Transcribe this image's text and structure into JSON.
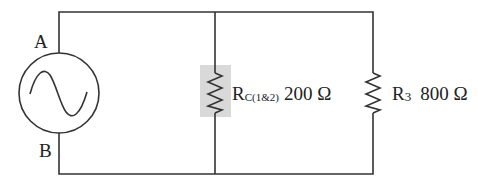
{
  "diagram": {
    "type": "circuit",
    "source": {
      "kind": "AC voltage source",
      "icon": "ac-source-icon",
      "terminals": {
        "top": "A",
        "bottom": "B"
      }
    },
    "resistors": [
      {
        "id": "rc12",
        "symbol": "R",
        "subscript": "C(1&2)",
        "value": "200 Ω",
        "highlighted": true,
        "highlight_color": "#d9d9d9"
      },
      {
        "id": "r3",
        "symbol": "R",
        "subscript": "3",
        "value": "800 Ω",
        "highlighted": false
      }
    ],
    "connection": "parallel",
    "colors": {
      "wire": "#333333",
      "text": "#222222",
      "highlight": "#d9d9d9"
    }
  }
}
